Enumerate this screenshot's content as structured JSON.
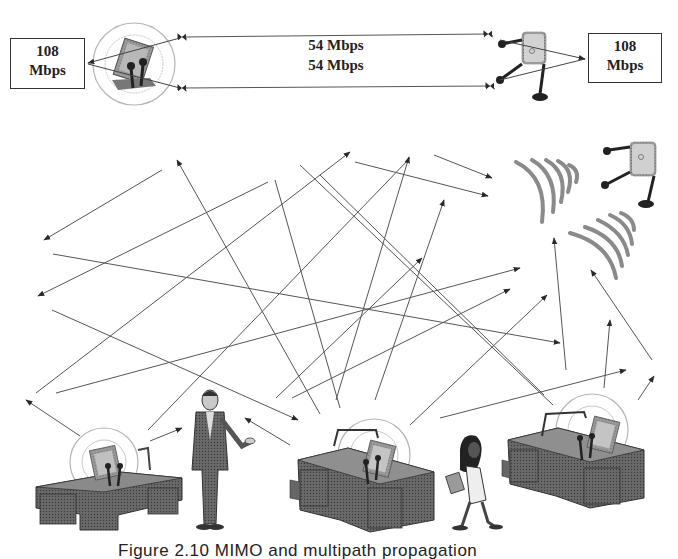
{
  "top_link": {
    "left_box": {
      "line1": "108",
      "line2": "Mbps"
    },
    "right_box": {
      "line1": "108",
      "line2": "Mbps"
    },
    "stream_labels": [
      "54 Mbps",
      "54 Mbps"
    ]
  },
  "scene": {
    "nodes": [
      {
        "name": "access-point-top-right",
        "type": "access-point"
      },
      {
        "name": "laptop-with-antennas-top-left",
        "type": "client-radio"
      },
      {
        "name": "desk-left",
        "type": "desk-with-client"
      },
      {
        "name": "desk-center",
        "type": "desk-with-client"
      },
      {
        "name": "desk-right",
        "type": "desk-with-client"
      },
      {
        "name": "man-in-suit",
        "type": "person"
      },
      {
        "name": "woman-walking",
        "type": "person"
      }
    ],
    "signal_waves": 2,
    "propagation_arrows": 34
  },
  "caption": "Figure 2.10  MIMO and multipath propagation",
  "colors": {
    "line": "#555555",
    "box_border": "#333333",
    "ring": "#aaaaaa",
    "wave": "#8a8a8a",
    "text": "#222222"
  }
}
